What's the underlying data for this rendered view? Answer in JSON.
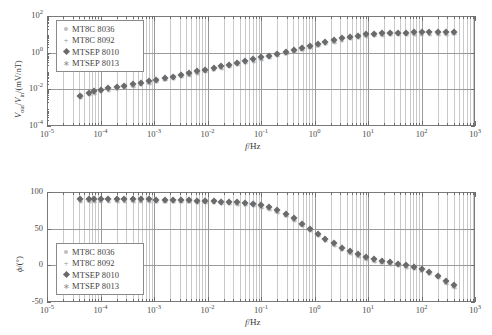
{
  "figure": {
    "xlabel": "f/Hz",
    "panels": [
      {
        "id": "amplitude",
        "ylabel_html": "V<sub>out</sub>/V<sub>in</sub>/(mV/nT)",
        "ylabel_plain": "Vout/Vin/(mV/nT)",
        "ytick_labels": [
          "10",
          "10",
          "10",
          "10"
        ],
        "ytick_exps": [
          "2",
          "0",
          "-2",
          "-4"
        ]
      },
      {
        "id": "phase",
        "ylabel_plain": "ϕ/(°)",
        "ytick_labels": [
          "100",
          "50",
          "0",
          "-50"
        ]
      }
    ],
    "xtick_labels": [
      "10",
      "10",
      "10",
      "10",
      "10",
      "10",
      "10",
      "10",
      "10"
    ],
    "xtick_exps": [
      "-5",
      "-4",
      "-3",
      "-2",
      "-1",
      "0",
      "1",
      "2",
      "3"
    ],
    "legend": {
      "items": [
        {
          "label": "MT8C 8036",
          "marker": "dot",
          "color": "#c2c2c2"
        },
        {
          "label": "MT8C 8092",
          "marker": "plus",
          "color": "#8d8d8d"
        },
        {
          "label": "MTSEP 8010",
          "marker": "diamond",
          "color": "#6a6a6a"
        },
        {
          "label": "MTSEP 8013",
          "marker": "star",
          "color": "#a8a8a8"
        }
      ]
    }
  },
  "chart_data": [
    {
      "type": "scatter",
      "title": "",
      "panel": "amplitude",
      "xlabel": "f/Hz",
      "ylabel": "Vout/Vin/(mV/nT)",
      "xscale": "log",
      "yscale": "log",
      "xlim": [
        1e-05,
        1000.0
      ],
      "ylim": [
        0.0001,
        100.0
      ],
      "grid": true,
      "legend_position": "upper-left",
      "x": [
        4.2e-05,
        6e-05,
        7.5e-05,
        0.0001,
        0.00014,
        0.0002,
        0.00028,
        0.0004,
        0.00056,
        0.0008,
        0.0011,
        0.0016,
        0.0023,
        0.0032,
        0.0045,
        0.0064,
        0.009,
        0.013,
        0.018,
        0.025,
        0.036,
        0.051,
        0.072,
        0.1,
        0.14,
        0.2,
        0.29,
        0.41,
        0.58,
        0.81,
        1.15,
        1.6,
        2.3,
        3.2,
        4.6,
        6.5,
        9.1,
        13.0,
        18.0,
        26.0,
        36.0,
        51.0,
        72.0,
        100.0,
        140.0,
        200.0,
        290.0,
        400.0
      ],
      "series": [
        {
          "name": "MTSEP 8010",
          "values": [
            0.0045,
            0.0065,
            0.008,
            0.0095,
            0.0115,
            0.0135,
            0.016,
            0.019,
            0.023,
            0.028,
            0.034,
            0.041,
            0.05,
            0.062,
            0.076,
            0.094,
            0.116,
            0.145,
            0.18,
            0.22,
            0.28,
            0.35,
            0.44,
            0.56,
            0.7,
            0.88,
            1.1,
            1.4,
            1.8,
            2.3,
            3.0,
            3.8,
            4.8,
            6.0,
            7.3,
            8.6,
            9.8,
            10.8,
            11.5,
            12.0,
            12.3,
            12.5,
            12.6,
            12.7,
            12.8,
            13.0,
            13.2,
            13.5
          ]
        },
        {
          "name": "MT8C 8036",
          "values": "same-as-MTSEP-8010"
        },
        {
          "name": "MT8C 8092",
          "values": "same-as-MTSEP-8010"
        },
        {
          "name": "MTSEP 8013",
          "values": "same-as-MTSEP-8010"
        }
      ]
    },
    {
      "type": "scatter",
      "title": "",
      "panel": "phase",
      "xlabel": "f/Hz",
      "ylabel": "ϕ/(°)",
      "xscale": "log",
      "yscale": "linear",
      "xlim": [
        1e-05,
        1000.0
      ],
      "ylim": [
        -50,
        100
      ],
      "grid": true,
      "legend_position": "lower-left",
      "x": [
        4.2e-05,
        6e-05,
        7.5e-05,
        0.0001,
        0.00014,
        0.0002,
        0.00028,
        0.0004,
        0.00056,
        0.0008,
        0.0011,
        0.0016,
        0.0023,
        0.0032,
        0.0045,
        0.0064,
        0.009,
        0.013,
        0.018,
        0.025,
        0.036,
        0.051,
        0.072,
        0.1,
        0.14,
        0.2,
        0.29,
        0.41,
        0.58,
        0.81,
        1.15,
        1.6,
        2.3,
        3.2,
        4.6,
        6.5,
        9.1,
        13.0,
        18.0,
        26.0,
        36.0,
        51.0,
        72.0,
        100.0,
        140.0,
        200.0,
        290.0,
        400.0
      ],
      "series": [
        {
          "name": "MTSEP 8010",
          "values": [
            90,
            90,
            90,
            90,
            90,
            90,
            90,
            90,
            90,
            90,
            89,
            89,
            89,
            89,
            89,
            88,
            88,
            88,
            87,
            87,
            86,
            85,
            84,
            82,
            79,
            75,
            70,
            64,
            57,
            50,
            43,
            36,
            30,
            24,
            19,
            15,
            11,
            8,
            6,
            4,
            2,
            0,
            -2,
            -5,
            -9,
            -14,
            -22,
            -27
          ]
        },
        {
          "name": "MT8C 8036",
          "values": "same-as-MTSEP-8010"
        },
        {
          "name": "MT8C 8092",
          "values": "same-as-MTSEP-8010"
        },
        {
          "name": "MTSEP 8013",
          "values": "same-as-MTSEP-8010"
        }
      ]
    }
  ]
}
